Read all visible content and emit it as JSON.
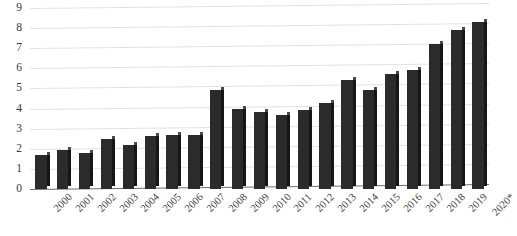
{
  "chart_data": {
    "type": "bar",
    "title": "",
    "subtitle": "",
    "xlabel": "",
    "ylabel": "",
    "categories": [
      "2000",
      "2001",
      "2002",
      "2003",
      "2004",
      "2005",
      "2006",
      "2007",
      "2008",
      "2009",
      "2010",
      "2011",
      "2012",
      "2013",
      "2014",
      "2015",
      "2016",
      "2017",
      "2018",
      "2019",
      "2020*"
    ],
    "values": [
      1.7,
      1.95,
      1.8,
      2.5,
      2.2,
      2.65,
      2.7,
      2.7,
      4.9,
      4.0,
      3.85,
      3.7,
      3.95,
      4.3,
      5.4,
      4.9,
      5.7,
      5.9,
      7.2,
      7.9,
      8.3
    ],
    "ylim": [
      0,
      9
    ],
    "ytick_labels": [
      "0",
      "1",
      "2",
      "3",
      "4",
      "5",
      "6",
      "7",
      "8",
      "9"
    ],
    "ytick_values": [
      0,
      1,
      2,
      3,
      4,
      5,
      6,
      7,
      8,
      9
    ],
    "grid": true,
    "legend": null,
    "legend_position": "none",
    "series": [
      {
        "name": "",
        "values": [
          1.7,
          1.95,
          1.8,
          2.5,
          2.2,
          2.65,
          2.7,
          2.7,
          4.9,
          4.0,
          3.85,
          3.7,
          3.95,
          4.3,
          5.4,
          4.9,
          5.7,
          5.9,
          7.2,
          7.9,
          8.3
        ],
        "color": "#2b2b2b"
      }
    ],
    "annotations": [
      "2020*"
    ],
    "colors": {
      "bar_face": "#2b2b2b",
      "bar_side": "#161616",
      "bar_top": "#4a4a4a",
      "gridline": "#e2e2e2",
      "axis_line": "#6f6f6f",
      "tick_label": "#3a3a3a",
      "background": "#ffffff"
    }
  }
}
